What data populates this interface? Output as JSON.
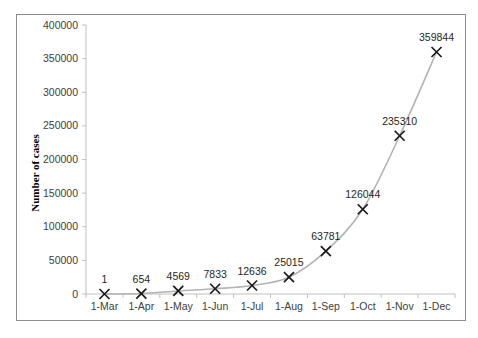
{
  "chart_data": {
    "type": "line",
    "title": "",
    "xlabel": "",
    "ylabel": "Number of cases",
    "categories": [
      "1-Mar",
      "1-Apr",
      "1-May",
      "1-Jun",
      "1-Jul",
      "1-Aug",
      "1-Sep",
      "1-Oct",
      "1-Nov",
      "1-Dec"
    ],
    "series": [
      {
        "name": "Number of cases",
        "values": [
          1,
          654,
          4569,
          7833,
          12636,
          25015,
          63781,
          126044,
          235310,
          359844
        ],
        "marker": "x",
        "line": "smooth",
        "line_color": "#b3b3b3",
        "marker_color": "#1a1a1a"
      }
    ],
    "data_labels": [
      "1",
      "654",
      "4569",
      "7833",
      "12636",
      "25015",
      "63781",
      "126044",
      "235310",
      "359844"
    ],
    "ylim": [
      0,
      400000
    ],
    "yticks": [
      0,
      50000,
      100000,
      150000,
      200000,
      250000,
      300000,
      350000,
      400000
    ],
    "ytick_labels": [
      "0",
      "50000",
      "100000",
      "150000",
      "200000",
      "250000",
      "300000",
      "350000",
      "400000"
    ],
    "grid": false,
    "legend": null
  }
}
